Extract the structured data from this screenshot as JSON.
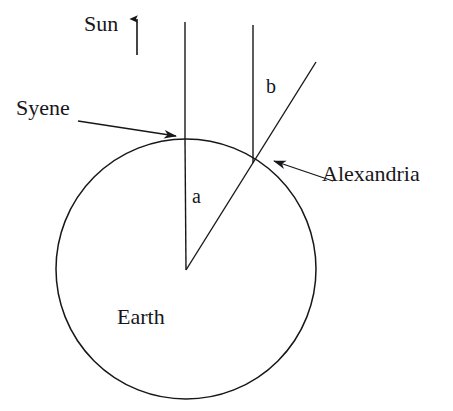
{
  "figure": {
    "width": 453,
    "height": 411,
    "background_color": "#ffffff",
    "stroke_color": "#17161a"
  },
  "labels": {
    "sun": "Sun",
    "syene": "Syene",
    "alexandria": "Alexandria",
    "earth": "Earth",
    "angle_a": "a",
    "angle_b": "b"
  },
  "geometry": {
    "earth_circle": {
      "cx": 186,
      "cy": 269,
      "r": 130
    },
    "sun_ray_syene": {
      "x1": 185,
      "y1": 22,
      "x2": 185,
      "y2": 139
    },
    "sun_ray_alexandria": {
      "x1": 253,
      "y1": 25,
      "x2": 253,
      "y2": 163
    },
    "radius_syene": {
      "x1": 186,
      "y1": 270,
      "x2": 185,
      "y2": 139
    },
    "radius_alexandria": {
      "x1": 186,
      "y1": 270,
      "x2": 316,
      "y2": 62
    },
    "sun_direction_arrow": {
      "x1": 137,
      "y1": 55,
      "x2": 137,
      "y2": 17
    },
    "syene_pointer": {
      "x1": 78,
      "y1": 121,
      "x2": 176,
      "y2": 136
    },
    "alexandria_pointer": {
      "x1": 333,
      "y1": 181,
      "x2": 274,
      "y2": 161
    }
  }
}
